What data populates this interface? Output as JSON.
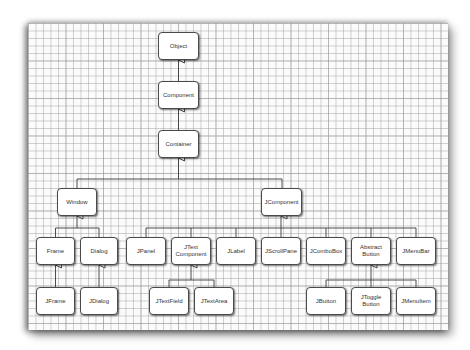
{
  "diagram": {
    "title": "",
    "type": "class-inheritance-hierarchy",
    "colors": {
      "paper": "#fbfbfb",
      "grid": "#c8c8c8",
      "box_border": "#4a4a4a",
      "line": "#3a3a3a",
      "text": "#333333"
    },
    "nodes": {
      "object": "Object",
      "component": "Component",
      "container": "Container",
      "window": "Window",
      "jcomponent": "JComponent",
      "frame": "Frame",
      "dialog": "Dialog",
      "jpanel": "JPanel",
      "jtextcomponent": "JText\nComponent",
      "jlabel": "JLabel",
      "jscrollpane": "JScrollPane",
      "jcombobox": "JComboBox",
      "abstractbutton": "Abstract\nButton",
      "jmenubar": "JMenuBar",
      "jframe": "JFrame",
      "jdialog": "JDialog",
      "jtextfield": "JTextField",
      "jtextarea": "JTextArea",
      "jbutton": "JButton",
      "jtogglebutton": "JToggle\nButton",
      "jmenuitem": "JMenuItem"
    },
    "edges": [
      [
        "Component",
        "Object"
      ],
      [
        "Container",
        "Component"
      ],
      [
        "Window",
        "Container"
      ],
      [
        "JComponent",
        "Container"
      ],
      [
        "Frame",
        "Window"
      ],
      [
        "Dialog",
        "Window"
      ],
      [
        "JFrame",
        "Frame"
      ],
      [
        "JDialog",
        "Dialog"
      ],
      [
        "JPanel",
        "JComponent"
      ],
      [
        "JTextComponent",
        "JComponent"
      ],
      [
        "JLabel",
        "JComponent"
      ],
      [
        "JScrollPane",
        "JComponent"
      ],
      [
        "JComboBox",
        "JComponent"
      ],
      [
        "AbstractButton",
        "JComponent"
      ],
      [
        "JMenuBar",
        "JComponent"
      ],
      [
        "JTextField",
        "JTextComponent"
      ],
      [
        "JTextArea",
        "JTextComponent"
      ],
      [
        "JButton",
        "AbstractButton"
      ],
      [
        "JToggleButton",
        "AbstractButton"
      ],
      [
        "JMenuItem",
        "AbstractButton"
      ]
    ]
  }
}
